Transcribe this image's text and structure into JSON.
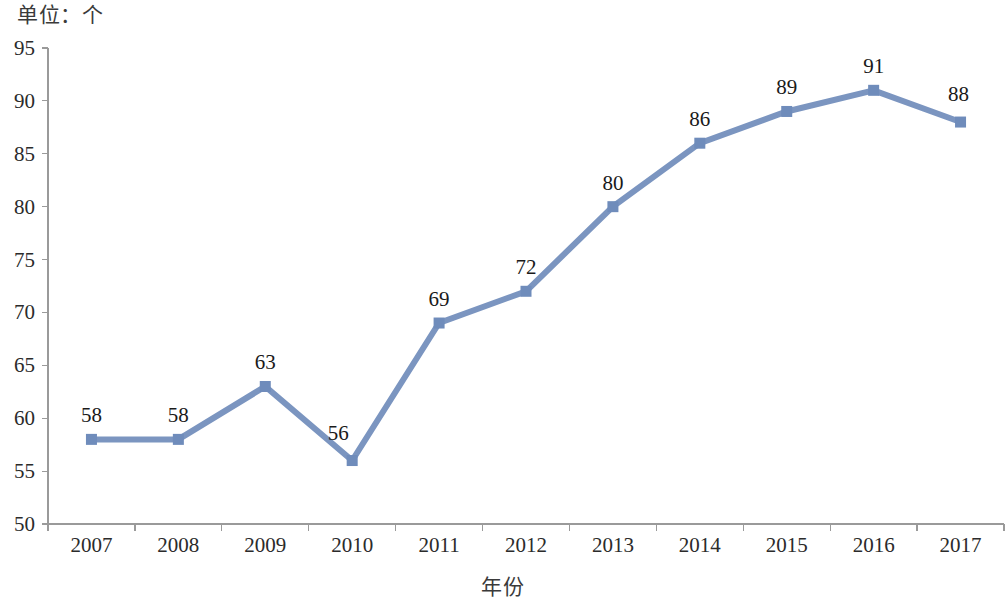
{
  "caption": {
    "unit_label": "单位：个"
  },
  "axis_title": {
    "x": "年份",
    "y": ""
  },
  "chart_data": {
    "type": "line",
    "title": "",
    "subtitle": "",
    "xlabel": "年份",
    "ylabel": "",
    "unit_note": "单位：个",
    "categories": [
      "2007",
      "2008",
      "2009",
      "2010",
      "2011",
      "2012",
      "2013",
      "2014",
      "2015",
      "2016",
      "2017"
    ],
    "values": [
      58,
      58,
      63,
      56,
      69,
      72,
      80,
      86,
      89,
      91,
      88
    ],
    "point_labels": [
      "58",
      "58",
      "63",
      "56",
      "69",
      "72",
      "80",
      "86",
      "89",
      "91",
      "88"
    ],
    "ylim": [
      50,
      95
    ],
    "ytick_step": 5,
    "ytick_labels": [
      "95",
      "90",
      "85",
      "80",
      "75",
      "70",
      "65",
      "60",
      "55",
      "50"
    ],
    "ytick_values": [
      95,
      90,
      85,
      80,
      75,
      70,
      65,
      60,
      55,
      50
    ],
    "grid": false,
    "legend": "none",
    "series_color": "#7b95c0",
    "marker_color": "#6f8cbb",
    "marker_shape": "square",
    "axis_color": "#9a9a9a",
    "text_color": "#1a1a1a"
  }
}
